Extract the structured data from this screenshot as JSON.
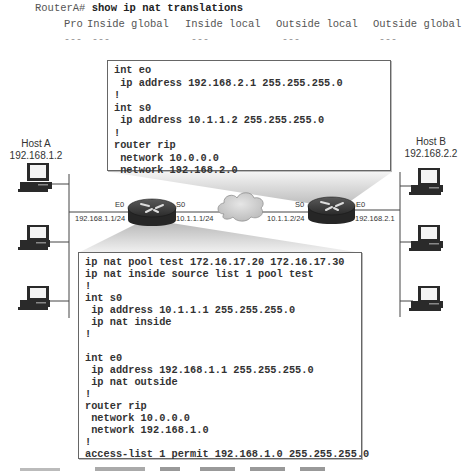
{
  "command": {
    "prompt": "RouterA#",
    "text": "show ip nat translations"
  },
  "nat_table": {
    "columns": [
      "Pro",
      "Inside global",
      "Inside local",
      "Outside local",
      "Outside global"
    ],
    "rows": [
      [
        "---",
        "---",
        "---",
        "---",
        "---"
      ]
    ]
  },
  "router_b_config": {
    "lines": [
      "int eo",
      " ip address 192.168.2.1 255.255.255.0",
      "!",
      "int s0",
      " ip address 10.1.1.2 255.255.255.0",
      "!",
      "router rip",
      " network 10.0.0.0",
      " network 192.168.2.0"
    ]
  },
  "router_a_config": {
    "lines": [
      "ip nat pool test 172.16.17.20 172.16.17.30",
      "ip nat inside source list 1 pool test",
      "!",
      "int s0",
      " ip address 10.1.1.1 255.255.255.0",
      " ip nat inside",
      "!",
      "",
      "int e0",
      " ip address 192.168.1.1 255.255.255.0",
      " ip nat outside",
      "!",
      "router rip",
      " network 10.0.0.0",
      " network 192.168.1.0",
      "!",
      "access-list 1 permit 192.168.1.0 255.255.255.0"
    ]
  },
  "host_a": {
    "name": "Host A",
    "ip": "192.168.1.2"
  },
  "host_b": {
    "name": "Host B",
    "ip": "192.168.2.2"
  },
  "router_a": {
    "e0_label": "E0",
    "e0_ip": "192.168.1.1/24",
    "s0_label": "S0",
    "s0_ip": "10.1.1.1/24"
  },
  "router_b": {
    "s0_label": "S0",
    "s0_ip": "10.1.1.2/24",
    "e0_label": "E0",
    "e0_ip": "192.168.2.1"
  },
  "colors": {
    "box_border": "#666666",
    "router_body": "#2b2b2b",
    "cloud_fill": "#cfcfcf",
    "beam_gray": "#d9d9d9"
  }
}
